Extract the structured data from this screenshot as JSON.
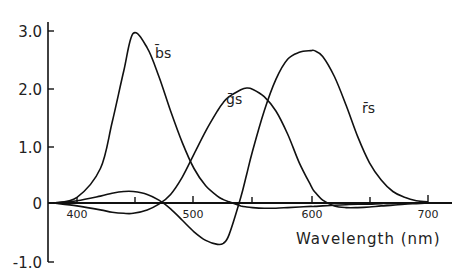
{
  "chart_data": {
    "type": "line",
    "title": "",
    "xlabel": "Wavelength (nm)",
    "ylabel": "",
    "xlim": [
      375,
      720
    ],
    "ylim": [
      -1.0,
      3.0
    ],
    "grid": false,
    "legend": "inline curve labels",
    "x_ticks": [
      400,
      450,
      500,
      550,
      600,
      650,
      700
    ],
    "x_tick_labels": [
      "400",
      "500",
      "600",
      "700"
    ],
    "y_ticks": [
      3.0,
      2.0,
      1.0,
      0,
      -1.0
    ],
    "y_tick_labels": [
      "3.0",
      "2.0",
      "1.0",
      "0",
      "-1.0"
    ],
    "x": [
      380,
      400,
      420,
      430,
      440,
      448,
      460,
      470,
      480,
      490,
      500,
      510,
      520,
      525,
      530,
      540,
      545,
      550,
      560,
      570,
      580,
      590,
      600,
      603,
      610,
      620,
      630,
      640,
      650,
      660,
      670,
      680,
      690,
      700
    ],
    "series": [
      {
        "name": "b̄s",
        "label": "b̄s",
        "values": [
          0.0,
          0.1,
          0.6,
          1.4,
          2.3,
          2.95,
          2.7,
          2.2,
          1.6,
          1.05,
          0.6,
          0.3,
          0.12,
          0.06,
          0.02,
          -0.05,
          -0.07,
          -0.08,
          -0.09,
          -0.09,
          -0.08,
          -0.07,
          -0.06,
          -0.06,
          -0.05,
          -0.04,
          -0.03,
          -0.02,
          -0.02,
          -0.01,
          -0.01,
          0.0,
          0.0,
          0.0
        ]
      },
      {
        "name": "ḡs",
        "label": "ḡs",
        "values": [
          0.0,
          -0.05,
          -0.12,
          -0.16,
          -0.18,
          -0.18,
          -0.12,
          -0.02,
          0.15,
          0.45,
          0.85,
          1.25,
          1.6,
          1.75,
          1.85,
          1.97,
          2.0,
          1.98,
          1.85,
          1.6,
          1.2,
          0.7,
          0.3,
          0.2,
          0.05,
          -0.05,
          -0.08,
          -0.08,
          -0.07,
          -0.05,
          -0.04,
          -0.02,
          -0.01,
          0.0
        ]
      },
      {
        "name": "r̄s",
        "label": "r̄s",
        "values": [
          0.0,
          0.04,
          0.12,
          0.17,
          0.2,
          0.2,
          0.15,
          0.05,
          -0.1,
          -0.3,
          -0.5,
          -0.65,
          -0.72,
          -0.7,
          -0.55,
          0.1,
          0.5,
          0.9,
          1.6,
          2.15,
          2.5,
          2.62,
          2.65,
          2.65,
          2.55,
          2.2,
          1.7,
          1.15,
          0.7,
          0.4,
          0.2,
          0.1,
          0.04,
          0.02
        ]
      }
    ],
    "annotations": [
      "b̄s",
      "ḡs",
      "r̄s"
    ]
  },
  "labels": {
    "y_3": "3.0",
    "y_2": "2.0",
    "y_1": "1.0",
    "y_0": "0",
    "y_m1": "-1.0",
    "x_400": "400",
    "x_500": "500",
    "x_600": "600",
    "x_700": "700",
    "xlabel": "Wavelength (nm)",
    "b_label": "b̄s",
    "g_label": "ḡs",
    "r_label": "r̄s"
  }
}
